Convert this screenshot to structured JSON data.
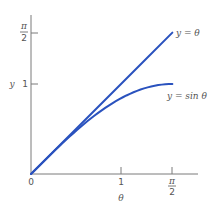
{
  "chart_data": {
    "type": "line",
    "title": "",
    "xlabel": "θ",
    "ylabel": "y",
    "xlim": [
      0,
      1.5708
    ],
    "ylim": [
      0,
      1.5708
    ],
    "grid": false,
    "x_ticks": [
      {
        "value": 0,
        "label": "0"
      },
      {
        "value": 1,
        "label": "1"
      },
      {
        "value": 1.5708,
        "label_num": "π",
        "label_den": "2"
      }
    ],
    "y_ticks": [
      {
        "value": 1,
        "label": "1"
      },
      {
        "value": 1.5708,
        "label_num": "π",
        "label_den": "2"
      }
    ],
    "series": [
      {
        "name": "y = θ",
        "color": "#2a52be",
        "x": [
          0,
          0.25,
          0.5,
          0.75,
          1.0,
          1.25,
          1.5708
        ],
        "values": [
          0,
          0.25,
          0.5,
          0.75,
          1.0,
          1.25,
          1.5708
        ]
      },
      {
        "name": "y = sin θ",
        "color": "#2a52be",
        "x": [
          0,
          0.25,
          0.5,
          0.75,
          1.0,
          1.25,
          1.5708
        ],
        "values": [
          0,
          0.247,
          0.479,
          0.682,
          0.841,
          0.949,
          1.0
        ]
      }
    ],
    "annotations": [
      {
        "text": "y = θ",
        "near_series": 0
      },
      {
        "text": "y = sin θ",
        "near_series": 1
      }
    ]
  },
  "labels": {
    "origin": "0",
    "x_one": "1",
    "y_one": "1",
    "pi": "π",
    "two": "2",
    "ylabel": "y",
    "xlabel": "θ",
    "line_label": "y = θ",
    "sin_label": "y = sin θ"
  }
}
